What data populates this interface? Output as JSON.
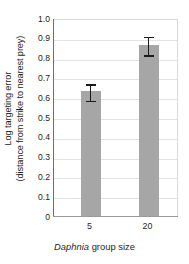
{
  "chart_data": {
    "type": "bar",
    "title": "",
    "subtitle": "",
    "xlabel_italic": "Daphnia",
    "xlabel_rest": " group size",
    "xlabel_full": "Daphnia group size",
    "ylabel_line1": "Log targeting error",
    "ylabel_line2": "(distance from strike to nearest prey)",
    "ylabel_full": "Log targeting error (distance from strike to nearest prey)",
    "categories": [
      "5",
      "20"
    ],
    "values": [
      0.63,
      0.865
    ],
    "errors": [
      0.045,
      0.05
    ],
    "error_type": "symmetric",
    "ylim": [
      0,
      1.0
    ],
    "yticks": [
      "1.0",
      "0.9",
      "0.8",
      "0.7",
      "0.6",
      "0.5",
      "0.4",
      "0.3",
      "0.2",
      "0.1",
      "0"
    ],
    "ytick_values": [
      1.0,
      0.9,
      0.8,
      0.7,
      0.6,
      0.5,
      0.4,
      0.3,
      0.2,
      0.1,
      0
    ],
    "grid": true,
    "grid_axis": "y",
    "legend": false,
    "legend_position": "none",
    "bar_color": "#a6a6a6",
    "error_color": "#1a1a1a",
    "grid_color": "#e3e3e3",
    "axis_color": "#6e6e6e",
    "background": "#ffffff"
  }
}
